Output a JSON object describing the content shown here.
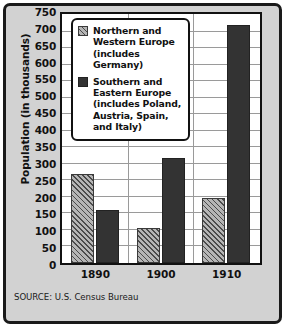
{
  "chart_data": {
    "type": "bar",
    "title": "",
    "xlabel": "",
    "ylabel": "Population (in thousands)",
    "categories": [
      "1890",
      "1900",
      "1910"
    ],
    "series": [
      {
        "name": "Northern and Western Europe (includes Germany)",
        "pattern": "hatched",
        "color": "#8f8f8f",
        "values": [
          270,
          107,
          198
        ]
      },
      {
        "name": "Southern and Eastern Europe (includes Poland, Austria, Spain, and Italy)",
        "pattern": "solid",
        "color": "#333333",
        "values": [
          160,
          318,
          720
        ]
      }
    ],
    "ylim": [
      0,
      750
    ],
    "ytick_step": 50,
    "yticks": [
      0,
      50,
      100,
      150,
      200,
      250,
      300,
      350,
      400,
      450,
      500,
      550,
      600,
      650,
      700,
      750
    ],
    "grid": true,
    "legend_position": "upper-left-inside"
  },
  "legend": {
    "entries": [
      {
        "swatch": "hatched",
        "lines": [
          "Northern and",
          "Western Europe",
          "(includes Germany)"
        ]
      },
      {
        "swatch": "solid",
        "lines": [
          "Southern and",
          "Eastern Europe",
          "(includes Poland,",
          "Austria, Spain,",
          "and Italy)"
        ]
      }
    ]
  },
  "source": {
    "text": "SOURCE: U.S. Census Bureau"
  }
}
